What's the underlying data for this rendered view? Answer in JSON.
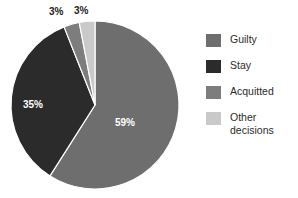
{
  "chart_data": {
    "type": "pie",
    "title": "",
    "categories": [
      "Guilty",
      "Stay",
      "Acquitted",
      "Other decisions"
    ],
    "values": [
      59,
      35,
      3,
      3
    ],
    "value_labels": [
      "59%",
      "35%",
      "3%",
      "3%"
    ],
    "unit": "%",
    "colors": [
      "#6e6e6e",
      "#2b2b2b",
      "#7d7d7d",
      "#c9c9c9"
    ],
    "legend_position": "right",
    "grid": false,
    "start_angle_deg": 0,
    "direction": "clockwise",
    "slices": [
      {
        "label": "Guilty",
        "value": 59,
        "value_label": "59%",
        "color": "#6e6e6e",
        "label_color": "#ffffff",
        "label_placement": "inside"
      },
      {
        "label": "Stay",
        "value": 35,
        "value_label": "35%",
        "color": "#2b2b2b",
        "label_color": "#ffffff",
        "label_placement": "inside"
      },
      {
        "label": "Acquitted",
        "value": 3,
        "value_label": "3%",
        "color": "#7d7d7d",
        "label_color": "#1c1c1c",
        "label_placement": "outside"
      },
      {
        "label": "Other decisions",
        "value": 3,
        "value_label": "3%",
        "color": "#c9c9c9",
        "label_color": "#1c1c1c",
        "label_placement": "outside"
      }
    ]
  },
  "pie": {
    "center_x": 95,
    "center_y": 105,
    "radius": 84,
    "labels": {
      "guilty": "59%",
      "stay": "35%",
      "acquitted": "3%",
      "other": "3%"
    }
  },
  "legend": {
    "items": [
      {
        "label": "Guilty",
        "color": "#6e6e6e"
      },
      {
        "label": "Stay",
        "color": "#2b2b2b"
      },
      {
        "label": "Acquitted",
        "color": "#7d7d7d"
      },
      {
        "label": "Other\ndecisions",
        "color": "#c9c9c9"
      }
    ]
  }
}
